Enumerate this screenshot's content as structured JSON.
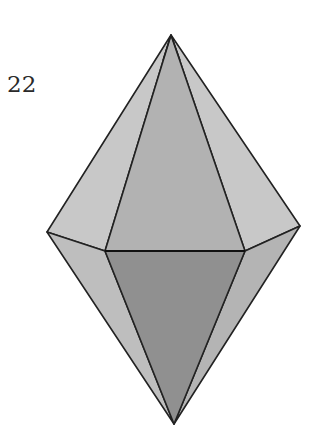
{
  "figure": {
    "number": "22",
    "colors": {
      "light_face": "#c6c6c6",
      "mid_face": "#b0b0b0",
      "side_lower_face": "#bdbdbd",
      "dark_face": "#8f8f8f",
      "edge": "#222222"
    }
  }
}
